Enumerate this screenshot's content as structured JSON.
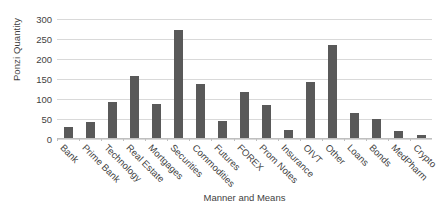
{
  "chart_data": {
    "type": "bar",
    "title": "",
    "xlabel": "Manner and Means",
    "ylabel": "Ponzi Quantity",
    "ylim": [
      0,
      300
    ],
    "yticks": [
      0,
      50,
      100,
      150,
      200,
      250,
      300
    ],
    "grid": true,
    "legend": false,
    "bar_color": "#595959",
    "gridline_color": "#d9d9d9",
    "text_color": "#3f3f3f",
    "categories": [
      "Bank",
      "Prime Bank",
      "Technology",
      "Real Estate",
      "Mortgages",
      "Securities",
      "Commodities",
      "Futures",
      "FOREX",
      "Prom Notes",
      "Insurance",
      "OIVT",
      "Other",
      "Loans",
      "Bonds",
      "MedPharm",
      "Crypto"
    ],
    "values": [
      27,
      39,
      90,
      154,
      86,
      271,
      134,
      43,
      116,
      82,
      21,
      140,
      233,
      63,
      48,
      18,
      8
    ],
    "series": [
      {
        "name": "Ponzi Quantity",
        "values": [
          27,
          39,
          90,
          154,
          86,
          271,
          134,
          43,
          116,
          82,
          21,
          140,
          233,
          63,
          48,
          18,
          8
        ]
      }
    ]
  }
}
